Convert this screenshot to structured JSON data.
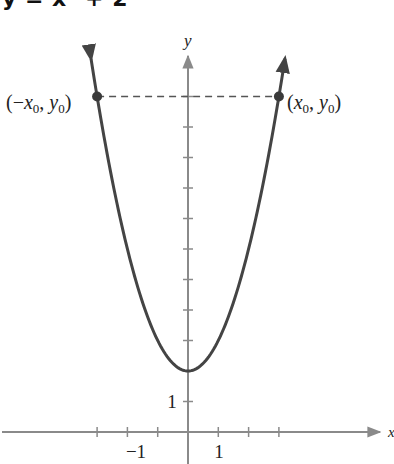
{
  "title": "y = x² + 2",
  "chart_data": {
    "type": "line",
    "title": "y = x² + 2",
    "function": "y = x^2 + 2",
    "xlabel": "x",
    "ylabel": "y",
    "xlim": [
      -6,
      6.3
    ],
    "ylim": [
      -1,
      13
    ],
    "grid": false,
    "legend": "none",
    "x_tick_labels": [
      {
        "value": -1,
        "label": "−1"
      },
      {
        "value": 1,
        "label": "1"
      }
    ],
    "y_tick_labels": [
      {
        "value": 1,
        "label": "1"
      }
    ],
    "x_ticks": [
      -3,
      -2,
      -1,
      1,
      2,
      3
    ],
    "y_ticks": [
      1,
      2,
      3,
      4,
      5,
      6,
      7,
      8,
      9,
      10,
      11
    ],
    "series": [
      {
        "name": "y = x^2 + 2",
        "x": [
          -3.2,
          -3,
          -2.5,
          -2,
          -1.5,
          -1,
          -0.5,
          0,
          0.5,
          1,
          1.5,
          2,
          2.5,
          3,
          3.2
        ],
        "values": [
          12.24,
          11,
          8.25,
          6,
          4.25,
          3,
          2.25,
          2,
          2.25,
          3,
          4.25,
          6,
          8.25,
          11,
          12.24
        ],
        "color": "#444444"
      }
    ],
    "annotations": [
      {
        "type": "point",
        "x": -3,
        "y": 11,
        "label": "(−x₀, y₀)"
      },
      {
        "type": "point",
        "x": 3,
        "y": 11,
        "label": "(x₀, y₀)"
      },
      {
        "type": "dashed-line",
        "from": [
          -3,
          11
        ],
        "to": [
          3,
          11
        ]
      }
    ]
  },
  "labels": {
    "y_axis": "y",
    "x_axis": "x",
    "left_point": {
      "open": "(−",
      "x": "x",
      "sub": "0",
      "comma": ", ",
      "y": "y",
      "sub2": "0",
      "close": ")"
    },
    "right_point": {
      "open": "(",
      "x": "x",
      "sub": "0",
      "comma": ", ",
      "y": "y",
      "sub2": "0",
      "close": ")"
    },
    "tick_x_neg1": "−1",
    "tick_x_1": "1",
    "tick_y_1": "1"
  },
  "colors": {
    "curve": "#444444",
    "axis": "#8a8a8a",
    "dashed": "#555555",
    "point": "#3a3a3a"
  }
}
